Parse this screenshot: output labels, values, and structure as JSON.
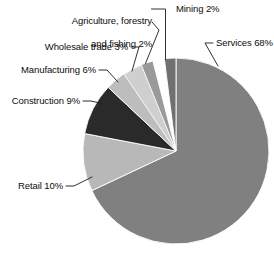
{
  "chart_data": {
    "type": "pie",
    "title": "",
    "subtitle": "",
    "xlabel": "",
    "ylabel": "",
    "legend_position": "none",
    "grid": false,
    "labels_show_percent": true,
    "start_angle_deg": 0,
    "direction": "clockwise",
    "categories": [
      "Services",
      "Retail",
      "Construction",
      "Manufacturing",
      "Wholesale trade",
      "Agriculture, forestry and fishing",
      "Mining"
    ],
    "values": [
      68,
      10,
      9,
      6,
      3,
      2,
      2
    ],
    "units": "percent",
    "slices": [
      {
        "name": "Services",
        "value": 68,
        "label": "Services 68%",
        "color": "#808080",
        "start_deg": 0,
        "end_deg": 244.8
      },
      {
        "name": "Retail",
        "value": 10,
        "label": "Retail 10%",
        "color": "#b8b8b8",
        "start_deg": 244.8,
        "end_deg": 280.8
      },
      {
        "name": "Construction",
        "value": 9,
        "label": "Construction 9%",
        "color": "#2a2a2a",
        "start_deg": 280.8,
        "end_deg": 313.2
      },
      {
        "name": "Manufacturing",
        "value": 6,
        "label": "Manufacturing 6%",
        "color": "#bdbdbd",
        "start_deg": 313.2,
        "end_deg": 334.8
      },
      {
        "name": "Wholesale trade",
        "value": 3,
        "label": "Wholesale trade 3%",
        "color": "#9a9a9a",
        "start_deg": 334.8,
        "end_deg": 345.6
      },
      {
        "name": "Agriculture, forestry and fishing",
        "value": 2,
        "label_line1": "Agriculture, forestry",
        "label_line2": "and fishing 2%",
        "label": "Agriculture, forestry and fishing 2%",
        "color": "#cfcfcf",
        "start_deg": 345.6,
        "end_deg": 352.8
      },
      {
        "name": "Mining",
        "value": 2,
        "label": "Mining 2%",
        "color": "#707070",
        "start_deg": 352.8,
        "end_deg": 360
      }
    ]
  },
  "labels": {
    "agriculture_line1": "Agriculture, forestry",
    "agriculture_line2": "and fishing 2%",
    "mining": "Mining 2%",
    "wholesale": "Wholesale trade 3%",
    "services": "Services 68%",
    "manufacturing": "Manufacturing 6%",
    "construction": "Construction 9%",
    "retail": "Retail 10%"
  },
  "colors": {
    "background": "#ffffff",
    "text": "#0d0d0d",
    "leader_line": "#1a1a1a",
    "slice_border": "#ffffff"
  },
  "geometry": {
    "center_x": 176,
    "center_y": 151,
    "radius": 93
  }
}
